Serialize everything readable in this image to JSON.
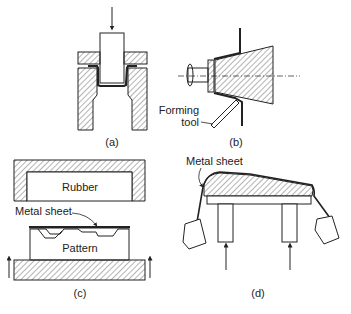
{
  "figure": {
    "panels": [
      {
        "id": "a",
        "caption": "(a)",
        "description": "Deep drawing: punch pushes sheet into die with blank holder"
      },
      {
        "id": "b",
        "caption": "(b)",
        "description": "Spinning over rotating mandrel",
        "labels": {
          "tool_line1": "Forming",
          "tool_line2": "tool"
        }
      },
      {
        "id": "c",
        "caption": "(c)",
        "description": "Rubber pad forming",
        "labels": {
          "rubber": "Rubber",
          "sheet": "Metal sheet",
          "pattern": "Pattern"
        }
      },
      {
        "id": "d",
        "caption": "(d)",
        "description": "Stretch forming over die with weighted grips",
        "labels": {
          "sheet": "Metal sheet"
        }
      }
    ]
  },
  "colors": {
    "stroke": "#222222",
    "background": "#ffffff"
  }
}
